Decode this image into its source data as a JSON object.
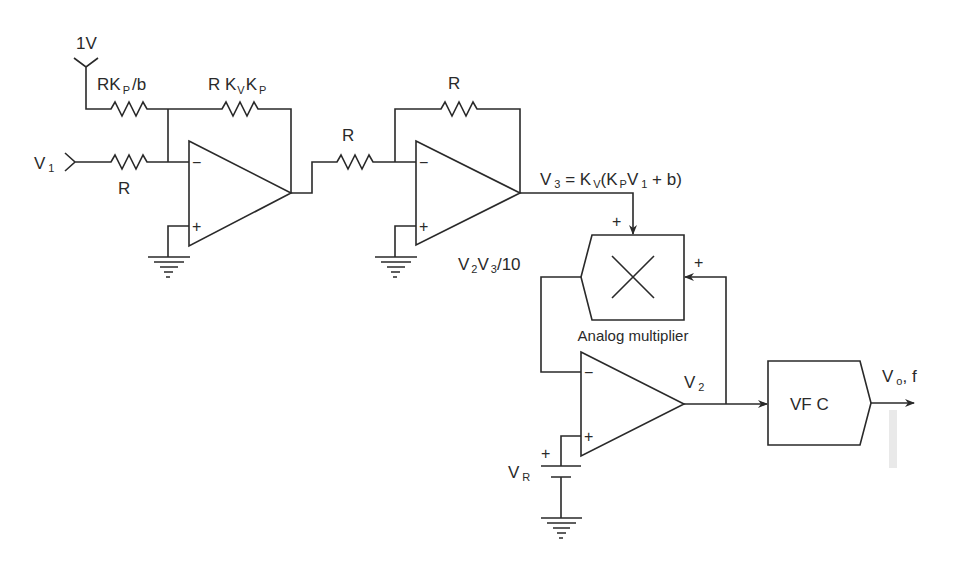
{
  "diagram": {
    "type": "circuit",
    "inputs": {
      "reference": "1V",
      "v1": {
        "main": "V",
        "sub": "1"
      }
    },
    "resistors": {
      "r_bias": {
        "pre": "RK",
        "sub": "P",
        "post": "/b"
      },
      "r_feedback1": {
        "pre": "R K",
        "sub1": "V",
        "mid": "K",
        "sub2": "P"
      },
      "r_in1": "R",
      "r_in2": "R",
      "r_feedback2": "R"
    },
    "signals": {
      "v3": {
        "v": "V",
        "sub3": "3",
        "eq": " = K",
        "subv": "V",
        "paren": "(K",
        "subp": "P",
        "v1": "V",
        "sub1": "1",
        "tail": " + b)"
      },
      "v2v3": {
        "a": "V",
        "s1": "2",
        "b": "V",
        "s2": "3",
        "c": "/10"
      },
      "v2": {
        "main": "V",
        "sub": "2"
      },
      "vr": {
        "main": "V",
        "sub": "R"
      },
      "vo": {
        "main": "V",
        "sub": "o",
        "tail": ", f"
      }
    },
    "blocks": {
      "multiplier_label": "Analog multiplier",
      "vfc_label": "VF C"
    },
    "signs": {
      "minus": "−",
      "plus": "+"
    }
  }
}
